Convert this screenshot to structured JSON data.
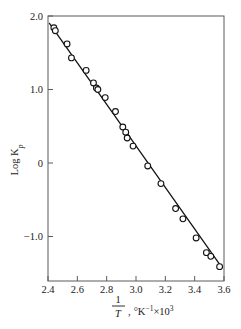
{
  "chart_data": {
    "type": "scatter",
    "title": "",
    "xlabel": "1/T , °K⁻¹×10³",
    "xlabel_parts": {
      "numerator": "1",
      "denominator": "T",
      "comma": ",",
      "units": "°K",
      "unit_exponent": "−1",
      "times": "×",
      "scale_base": "10",
      "scale_exponent": "3"
    },
    "ylabel": "Log Kₚ",
    "ylabel_parts": {
      "main": "Log K",
      "subscript": "p"
    },
    "xlim": [
      2.4,
      3.6
    ],
    "ylim": [
      -1.45,
      2.0
    ],
    "xticks": [
      2.4,
      2.6,
      2.8,
      3.0,
      3.2,
      3.4,
      3.6
    ],
    "xticklabels": [
      "2.4",
      "2.6",
      "2.8",
      "3.0",
      "3.2",
      "3.4",
      "3.6"
    ],
    "yticks": [
      2.0,
      1.0,
      0.0,
      -1.0
    ],
    "yticklabels": [
      "2.0",
      "1.0",
      "0",
      "−1.0"
    ],
    "grid": false,
    "legend": false,
    "marker": "open-circle",
    "marker_color": "#ffffff",
    "marker_edge_color": "#141414",
    "line_color": "#141414",
    "frame_color": "#5a5a5a",
    "points": [
      {
        "x": 2.44,
        "y": 1.84
      },
      {
        "x": 2.45,
        "y": 1.8
      },
      {
        "x": 2.53,
        "y": 1.62
      },
      {
        "x": 2.56,
        "y": 1.43
      },
      {
        "x": 2.66,
        "y": 1.26
      },
      {
        "x": 2.71,
        "y": 1.09
      },
      {
        "x": 2.73,
        "y": 1.02
      },
      {
        "x": 2.74,
        "y": 1.0
      },
      {
        "x": 2.79,
        "y": 0.89
      },
      {
        "x": 2.86,
        "y": 0.7
      },
      {
        "x": 2.91,
        "y": 0.49
      },
      {
        "x": 2.93,
        "y": 0.42
      },
      {
        "x": 2.94,
        "y": 0.34
      },
      {
        "x": 2.98,
        "y": 0.23
      },
      {
        "x": 3.08,
        "y": -0.04
      },
      {
        "x": 3.17,
        "y": -0.28
      },
      {
        "x": 3.27,
        "y": -0.62
      },
      {
        "x": 3.32,
        "y": -0.76
      },
      {
        "x": 3.41,
        "y": -1.02
      },
      {
        "x": 3.48,
        "y": -1.22
      },
      {
        "x": 3.51,
        "y": -1.27
      },
      {
        "x": 3.57,
        "y": -1.41
      }
    ],
    "fit_line": {
      "x_start": 2.41,
      "y_start": 1.9,
      "x_end": 3.585,
      "y_end": -1.42
    },
    "series": [
      {
        "name": "Log Kp vs 1/T",
        "x": [
          2.44,
          2.45,
          2.53,
          2.56,
          2.66,
          2.71,
          2.73,
          2.74,
          2.79,
          2.86,
          2.91,
          2.93,
          2.94,
          2.98,
          3.08,
          3.17,
          3.27,
          3.32,
          3.41,
          3.48,
          3.51,
          3.57
        ],
        "values": [
          1.84,
          1.8,
          1.62,
          1.43,
          1.26,
          1.09,
          1.02,
          1.0,
          0.89,
          0.7,
          0.49,
          0.42,
          0.34,
          0.23,
          -0.04,
          -0.28,
          -0.62,
          -0.76,
          -1.02,
          -1.22,
          -1.27,
          -1.41
        ]
      }
    ]
  }
}
